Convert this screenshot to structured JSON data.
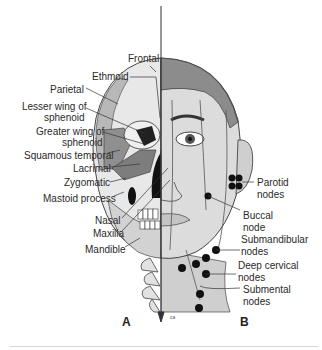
{
  "figure": {
    "panels": [
      {
        "id": "A",
        "label": "A",
        "subject": "skull bones"
      },
      {
        "id": "B",
        "label": "B",
        "subject": "facial lymph nodes"
      }
    ],
    "labels_left": [
      {
        "text": "Frontal"
      },
      {
        "text": "Ethmoid"
      },
      {
        "text": "Parietal"
      },
      {
        "text": "Lesser wing of"
      },
      {
        "text": "sphenoid"
      },
      {
        "text": "Greater wing of"
      },
      {
        "text": "sphenoid"
      },
      {
        "text": "Squamous temporal"
      },
      {
        "text": "Lacrimal"
      },
      {
        "text": "Zygomatic"
      },
      {
        "text": "Mastoid process"
      },
      {
        "text": "Nasal"
      },
      {
        "text": "Maxilla"
      },
      {
        "text": "Mandible"
      }
    ],
    "labels_right": [
      {
        "text": "Parotid"
      },
      {
        "text": "nodes"
      },
      {
        "text": "Buccal"
      },
      {
        "text": "node"
      },
      {
        "text": "Submandibular"
      },
      {
        "text": "nodes"
      },
      {
        "text": "Deep cervical"
      },
      {
        "text": "nodes"
      },
      {
        "text": "Submental"
      },
      {
        "text": "nodes"
      }
    ],
    "credit": "ca",
    "colors": {
      "skull_light": "#e6e6e6",
      "skull_mid": "#b5b5b5",
      "skull_dark": "#7d7d7d",
      "hair": "#8a8a8a",
      "skin": "#d9d9d9",
      "node": "#111111",
      "line": "#333333"
    }
  }
}
